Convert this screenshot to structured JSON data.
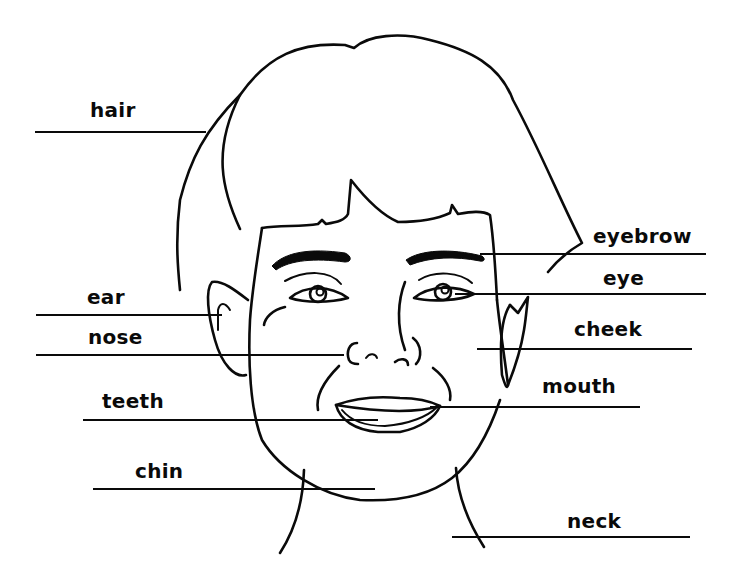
{
  "diagram": {
    "line_color": "#0a0a0a",
    "background": "#ffffff",
    "labels": [
      {
        "id": "hair",
        "text": "hair",
        "x": 90,
        "y": 100,
        "line": {
          "x1": 35,
          "y1": 132,
          "x2": 206,
          "y2": 132
        }
      },
      {
        "id": "ear",
        "text": "ear",
        "x": 87,
        "y": 287,
        "line": {
          "x1": 36,
          "y1": 315,
          "x2": 222,
          "y2": 315
        }
      },
      {
        "id": "nose",
        "text": "nose",
        "x": 88,
        "y": 327,
        "line": {
          "x1": 36,
          "y1": 355,
          "x2": 344,
          "y2": 355
        }
      },
      {
        "id": "teeth",
        "text": "teeth",
        "x": 102,
        "y": 391,
        "line": {
          "x1": 83,
          "y1": 420,
          "x2": 378,
          "y2": 420
        }
      },
      {
        "id": "chin",
        "text": "chin",
        "x": 135,
        "y": 461,
        "line": {
          "x1": 93,
          "y1": 489,
          "x2": 375,
          "y2": 489
        }
      },
      {
        "id": "eyebrow",
        "text": "eyebrow",
        "x": 593,
        "y": 226,
        "line": {
          "x1": 480,
          "y1": 254,
          "x2": 706,
          "y2": 254
        }
      },
      {
        "id": "eye",
        "text": "eye",
        "x": 603,
        "y": 268,
        "line": {
          "x1": 455,
          "y1": 294,
          "x2": 706,
          "y2": 294
        }
      },
      {
        "id": "cheek",
        "text": "cheek",
        "x": 574,
        "y": 319,
        "line": {
          "x1": 477,
          "y1": 349,
          "x2": 692,
          "y2": 349
        }
      },
      {
        "id": "mouth",
        "text": "mouth",
        "x": 542,
        "y": 376,
        "line": {
          "x1": 430,
          "y1": 407,
          "x2": 640,
          "y2": 407
        }
      },
      {
        "id": "neck",
        "text": "neck",
        "x": 567,
        "y": 511,
        "line": {
          "x1": 452,
          "y1": 537,
          "x2": 690,
          "y2": 537
        }
      }
    ]
  }
}
